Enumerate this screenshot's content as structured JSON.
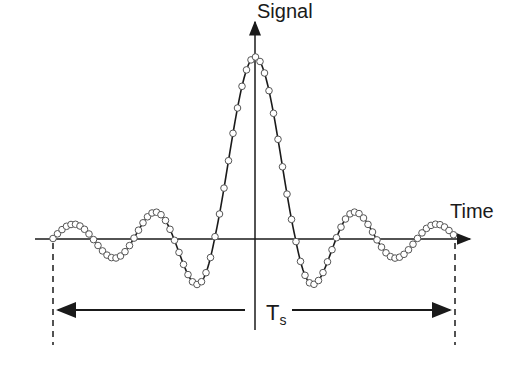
{
  "diagram": {
    "y_axis_label": "Signal",
    "x_axis_label": "Time",
    "span_label": "T",
    "span_label_subscript": "s",
    "colors": {
      "line": "#1a1a1a",
      "marker_fill": "#ffffff",
      "marker_stroke": "#555555"
    },
    "geometry": {
      "axis_y": 239,
      "center_x": 255,
      "peak_y": 57,
      "left_end_x": 53,
      "right_end_x": 455,
      "zero_spacing": 40.5
    }
  }
}
